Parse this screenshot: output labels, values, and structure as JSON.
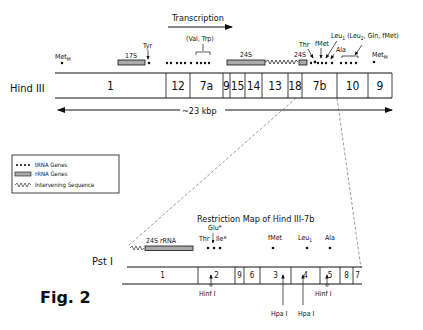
{
  "figure_label": "Fig. 2",
  "top_map": {
    "enzyme_label": "Hind III",
    "transcription_label": "Transcription",
    "size_label": "~23 kbp",
    "fragments": [
      "1",
      "12",
      "7a",
      "9",
      "15",
      "14",
      "13",
      "18",
      "7b",
      "10",
      "9"
    ],
    "gene_labels": {
      "met_m_left": "MetM",
      "rrna_17s": "17S",
      "tyr": "Tyr",
      "val_trp": "(Val, Trp)",
      "rrna_24s": "24S",
      "rrna_24s_small": "24S",
      "thr": "Thr",
      "fmet": "fMet",
      "leu_group": "Leu1 (Leu2, Gln, fMet)",
      "ala": "Ala",
      "met_m_right": "MetM"
    }
  },
  "legend": {
    "items": [
      {
        "symbol": "dots",
        "label": "tRNA Genes"
      },
      {
        "symbol": "bar",
        "label": "rRNA Genes"
      },
      {
        "symbol": "zigzag",
        "label": "Intervening Sequence"
      }
    ]
  },
  "bottom_map": {
    "title": "Restriction Map of Hind III-7b",
    "enzyme_label": "Pst I",
    "fragments": [
      "1",
      "2",
      "9",
      "6",
      "3",
      "4",
      "5",
      "8",
      "7"
    ],
    "gene_labels": {
      "rrna_24s": "24S rRNA",
      "glu": "Glu*",
      "thr": "Thr",
      "ile": "Ile*",
      "fmet": "fMet",
      "leu": "Leu1",
      "ala": "Ala"
    },
    "sites": [
      {
        "label": "Hinf I"
      },
      {
        "label": "Hpa I"
      },
      {
        "label": "Hpa I"
      },
      {
        "label": "Hinf I"
      }
    ]
  }
}
